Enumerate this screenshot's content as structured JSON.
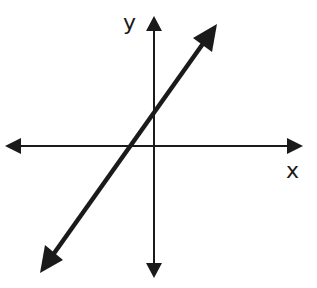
{
  "diagram": {
    "title": "",
    "axes": {
      "x_label": "x",
      "y_label": "y",
      "origin_px": [
        154,
        146
      ]
    },
    "line": {
      "slope_sign": "positive",
      "x_intercept_side": "negative",
      "y_intercept_side": "positive",
      "start_px": [
        40,
        273
      ],
      "end_px": [
        217,
        24
      ]
    },
    "colors": {
      "stroke": "#1a1a1a",
      "background": "#ffffff"
    }
  }
}
